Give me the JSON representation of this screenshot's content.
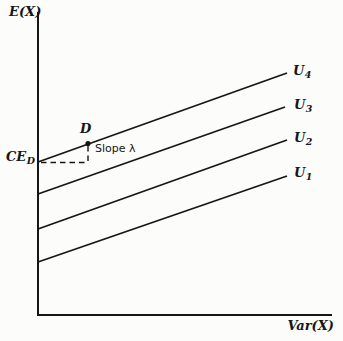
{
  "figure": {
    "ink_color": "#161616",
    "paper_color": "#fcfcfa",
    "y_axis_label": "E(X)",
    "x_axis_label": "Var(X)",
    "annotation": {
      "point_label": "D",
      "ce_label_base": "CE",
      "ce_label_sub": "D",
      "slope_label": "Slope λ"
    },
    "axes": {
      "origin_x": 38,
      "origin_y": 315,
      "y_axis_top": 12,
      "x_axis_right": 332,
      "stroke_width": 2
    },
    "curves": [
      {
        "name": "U4",
        "label_base": "U",
        "label_sub": "4",
        "x1": 38,
        "y1": 162,
        "x2": 287,
        "y2": 73
      },
      {
        "name": "U3",
        "label_base": "U",
        "label_sub": "3",
        "x1": 38,
        "y1": 194,
        "x2": 285,
        "y2": 107
      },
      {
        "name": "U2",
        "label_base": "U",
        "label_sub": "2",
        "x1": 38,
        "y1": 229,
        "x2": 287,
        "y2": 140
      },
      {
        "name": "U1",
        "label_base": "U",
        "label_sub": "1",
        "x1": 38,
        "y1": 262,
        "x2": 287,
        "y2": 176
      }
    ],
    "curve_stroke_width": 1.8,
    "dashed_guides": {
      "horizontal": {
        "x1": 41,
        "y1": 162.5,
        "x2": 88,
        "y2": 162.5
      },
      "vertical": {
        "x1": 88,
        "y1": 146,
        "x2": 88,
        "y2": 162.5
      },
      "dash_pattern": "5.5 4",
      "stroke_width": 1.4
    },
    "point_d": {
      "x": 88,
      "y": 143.5,
      "r": 2.6
    }
  }
}
